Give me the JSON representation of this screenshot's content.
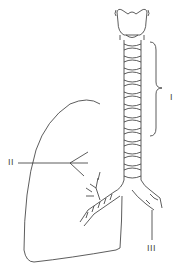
{
  "diagram": {
    "labels": [
      {
        "id": "I",
        "text": "I",
        "points_to": "trachea (bracket)"
      },
      {
        "id": "II",
        "text": "II",
        "points_to": "bronchioles in lung"
      },
      {
        "id": "III",
        "text": "III",
        "points_to": "right main bronchus"
      }
    ],
    "colors": {
      "line": "#333333",
      "background": "#ffffff"
    }
  }
}
